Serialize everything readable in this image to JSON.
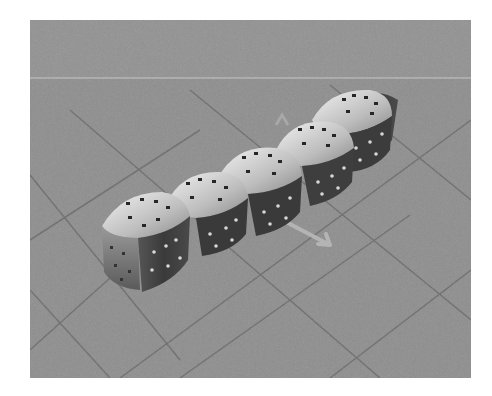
{
  "image": {
    "subject": "chain of five modular robot cubes on a tiled floor",
    "style": "grayscale 3D rendering",
    "cube_count": 5,
    "colors": {
      "background": "#ffffff",
      "floor": "#8d8d8d",
      "floor_lines": "#6a6a6a",
      "horizon_line": "#c8c8c8",
      "cube_light": "#e6e6e6",
      "cube_mid": "#9a9a9a",
      "cube_dark": "#3a3a3a",
      "connector": "#2a2a2a",
      "arrow": "#b4b4b4"
    }
  }
}
